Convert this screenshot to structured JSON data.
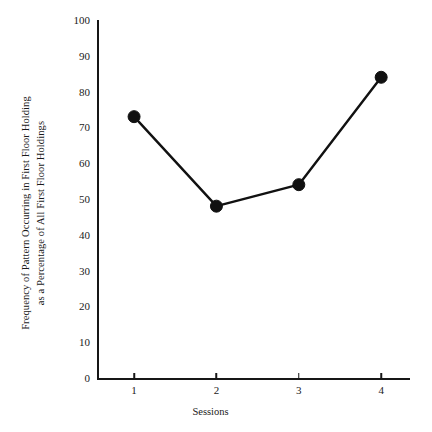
{
  "chart_data": {
    "type": "line",
    "title": "",
    "xlabel": "Sessions",
    "ylabel": "Frequency of Pattern Occurring in First Floor Holding as a Percentage of All First Floor Holdings",
    "ylabel_lines": [
      "Frequency of Pattern Occurring in First Floor Holding",
      "as a Percentage of All First Floor Holdings"
    ],
    "x": [
      1,
      2,
      3,
      4
    ],
    "values": [
      73,
      48,
      54,
      84
    ],
    "categories": [
      "1",
      "2",
      "3",
      "4"
    ],
    "xtick_labels": [
      "1",
      "2",
      "3",
      "4"
    ],
    "ytick_labels": [
      "0",
      "10",
      "20",
      "30",
      "40",
      "50",
      "60",
      "70",
      "80",
      "90",
      "100"
    ],
    "ytick_values": [
      0,
      10,
      20,
      30,
      40,
      50,
      60,
      70,
      80,
      90,
      100
    ],
    "xlim": [
      0.55,
      4.35
    ],
    "ylim": [
      0,
      100
    ],
    "grid": false,
    "legend": false,
    "series_color": "#111111",
    "marker": "filled-circle",
    "axis_color": "#161616"
  }
}
